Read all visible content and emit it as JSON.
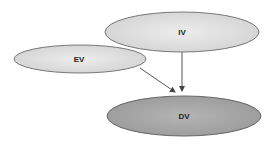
{
  "diagram": {
    "nodes": [
      {
        "id": "iv",
        "label": "IV",
        "fill": "#e3e3e3",
        "stroke": "#777777"
      },
      {
        "id": "ev",
        "label": "EV",
        "fill": "#dedede",
        "stroke": "#777777"
      },
      {
        "id": "dv",
        "label": "DV",
        "fill": "#a9a9a9",
        "stroke": "#666666"
      }
    ],
    "edges": [
      {
        "from": "IV",
        "to": "DV"
      },
      {
        "from": "EV",
        "to": "DV"
      }
    ]
  }
}
